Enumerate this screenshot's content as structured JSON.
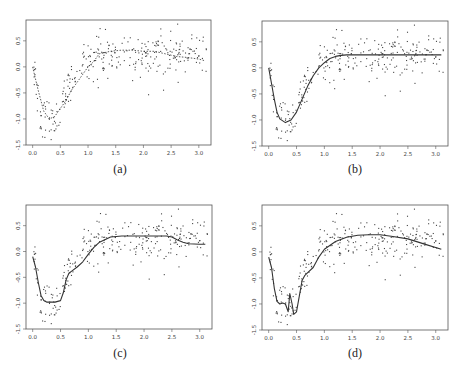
{
  "chart_data": [
    {
      "type": "scatter",
      "panel": "a",
      "caption": "(a)",
      "frame": {
        "left": 26,
        "top": 20,
        "right": 211,
        "bottom": 145
      },
      "xlim": [
        -0.12,
        3.22
      ],
      "ylim": [
        -1.5,
        0.9
      ],
      "xticks": [
        0.0,
        0.5,
        1.0,
        1.5,
        2.0,
        2.5,
        3.0
      ],
      "xtick_labels": [
        "0.0",
        "0.5",
        "1.0",
        "1.5",
        "2.0",
        "2.5",
        "3.0"
      ],
      "yticks": [
        0.5,
        0.0,
        -0.5,
        -1.0,
        -1.5
      ],
      "ytick_labels": [
        "0.5",
        "0.0",
        "-0.5",
        "-1.0",
        "-1.5"
      ],
      "curve_style": "dotted",
      "curve": {
        "x": [
          0.0,
          0.1,
          0.2,
          0.3,
          0.4,
          0.5,
          0.6,
          0.7,
          0.8,
          0.9,
          1.0,
          1.1,
          1.2,
          1.4,
          1.6,
          1.8,
          2.0,
          2.2,
          2.4,
          2.6,
          2.8,
          3.0,
          3.1
        ],
        "y": [
          0.0,
          -0.45,
          -0.85,
          -1.0,
          -0.95,
          -0.8,
          -0.65,
          -0.45,
          -0.3,
          -0.15,
          0.0,
          0.1,
          0.25,
          0.3,
          0.32,
          0.32,
          0.3,
          0.3,
          0.25,
          0.2,
          0.18,
          0.15,
          0.12
        ]
      }
    },
    {
      "type": "scatter",
      "panel": "b",
      "caption": "(b)",
      "frame": {
        "left": 262,
        "top": 21,
        "right": 448,
        "bottom": 146
      },
      "xlim": [
        -0.12,
        3.22
      ],
      "ylim": [
        -1.5,
        0.9
      ],
      "xticks": [
        0.0,
        0.5,
        1.0,
        1.5,
        2.0,
        2.5,
        3.0
      ],
      "xtick_labels": [
        "0.0",
        "0.5",
        "1.0",
        "1.5",
        "2.0",
        "2.5",
        "3.0"
      ],
      "yticks": [
        0.5,
        0.0,
        -0.5,
        -1.0,
        -1.5
      ],
      "ytick_labels": [
        "0.5",
        "0.0",
        "-0.5",
        "-1.0",
        "-1.5"
      ],
      "curve_style": "solid",
      "curve": {
        "x": [
          0.0,
          0.05,
          0.1,
          0.15,
          0.2,
          0.3,
          0.4,
          0.5,
          0.6,
          0.7,
          0.8,
          0.9,
          1.0,
          1.1,
          1.2,
          1.3,
          1.4,
          1.6,
          1.8,
          2.0,
          2.5,
          3.0,
          3.1
        ],
        "y": [
          0.0,
          -0.3,
          -0.6,
          -0.85,
          -0.98,
          -1.05,
          -1.0,
          -0.85,
          -0.6,
          -0.35,
          -0.15,
          0.0,
          0.1,
          0.18,
          0.22,
          0.24,
          0.25,
          0.25,
          0.25,
          0.25,
          0.25,
          0.25,
          0.25
        ]
      }
    },
    {
      "type": "scatter",
      "panel": "c",
      "caption": "(c)",
      "frame": {
        "left": 26,
        "top": 205,
        "right": 212,
        "bottom": 329
      },
      "xlim": [
        -0.12,
        3.22
      ],
      "ylim": [
        -1.5,
        0.9
      ],
      "xticks": [
        0.0,
        0.5,
        1.0,
        1.5,
        2.0,
        2.5,
        3.0
      ],
      "xtick_labels": [
        "0.0",
        "0.5",
        "1.0",
        "1.5",
        "2.0",
        "2.5",
        "3.0"
      ],
      "yticks": [
        0.5,
        0.0,
        -0.5,
        -1.0,
        -1.5
      ],
      "ytick_labels": [
        "0.5",
        "0.0",
        "-0.5",
        "-1.0",
        "-1.5"
      ],
      "curve_style": "solid",
      "curve": {
        "x": [
          0.0,
          0.05,
          0.1,
          0.15,
          0.2,
          0.25,
          0.3,
          0.4,
          0.5,
          0.55,
          0.6,
          0.65,
          0.7,
          0.8,
          0.9,
          1.0,
          1.1,
          1.2,
          1.4,
          1.6,
          1.8,
          2.0,
          2.2,
          2.4,
          2.5,
          2.6,
          2.7,
          2.8,
          3.0,
          3.1
        ],
        "y": [
          -0.1,
          -0.3,
          -0.6,
          -0.85,
          -0.95,
          -0.98,
          -0.98,
          -0.98,
          -0.95,
          -0.8,
          -0.55,
          -0.42,
          -0.38,
          -0.3,
          -0.2,
          -0.05,
          0.08,
          0.18,
          0.28,
          0.3,
          0.3,
          0.3,
          0.3,
          0.3,
          0.28,
          0.22,
          0.18,
          0.15,
          0.14,
          0.14
        ]
      }
    },
    {
      "type": "scatter",
      "panel": "d",
      "caption": "(d)",
      "frame": {
        "left": 262,
        "top": 205,
        "right": 448,
        "bottom": 330
      },
      "xlim": [
        -0.12,
        3.22
      ],
      "ylim": [
        -1.5,
        0.9
      ],
      "xticks": [
        0.0,
        0.5,
        1.0,
        1.5,
        2.0,
        2.5,
        3.0
      ],
      "xtick_labels": [
        "0.0",
        "0.5",
        "1.0",
        "1.5",
        "2.0",
        "2.5",
        "3.0"
      ],
      "yticks": [
        0.5,
        0.0,
        -0.5,
        -1.0,
        -1.5
      ],
      "ytick_labels": [
        "0.5",
        "0.0",
        "-0.5",
        "-1.0",
        "-1.5"
      ],
      "curve_style": "solid",
      "curve": {
        "x": [
          0.0,
          0.05,
          0.1,
          0.15,
          0.2,
          0.25,
          0.3,
          0.35,
          0.38,
          0.42,
          0.45,
          0.5,
          0.55,
          0.6,
          0.65,
          0.7,
          0.8,
          0.9,
          1.0,
          1.2,
          1.4,
          1.6,
          1.8,
          2.0,
          2.2,
          2.5,
          2.8,
          3.1
        ],
        "y": [
          -0.1,
          -0.3,
          -0.7,
          -0.95,
          -1.0,
          -0.98,
          -1.0,
          -1.15,
          -0.8,
          -1.0,
          -1.2,
          -1.15,
          -0.85,
          -0.55,
          -0.45,
          -0.4,
          -0.3,
          -0.1,
          0.05,
          0.2,
          0.28,
          0.32,
          0.33,
          0.33,
          0.3,
          0.25,
          0.15,
          0.05
        ]
      }
    }
  ],
  "scatter_cloud": {
    "description": "Noisy observations (~300 points per panel) around the same underlying function; identical data in all four panels",
    "n_points": 300,
    "x_range": [
      0.0,
      3.14
    ],
    "noise_sd": 0.22,
    "seed": 17
  },
  "colors": {
    "frame": "#555555",
    "points": "#444444",
    "curve": "#333333",
    "tick_label": "#444444"
  }
}
